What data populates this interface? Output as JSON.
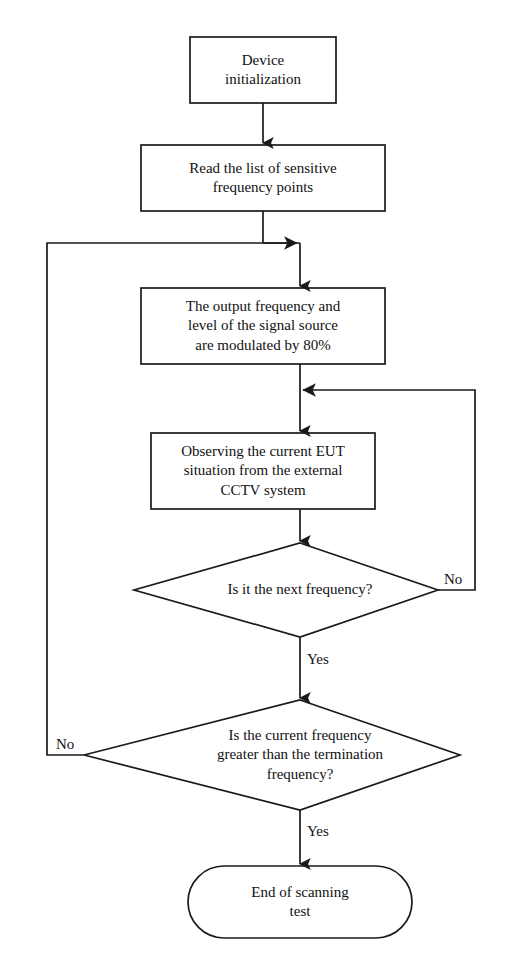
{
  "diagram": {
    "type": "flowchart",
    "orientation": "top-to-bottom",
    "stroke_color": "#1a1a1a",
    "fill_color": "#ffffff",
    "text_color": "#111111",
    "nodes": [
      {
        "id": "device-initialization",
        "shape": "rectangle",
        "text": "Device\ninitialization"
      },
      {
        "id": "read-sensitive-list",
        "shape": "rectangle",
        "text": "Read the list of sensitive\nfrequency points"
      },
      {
        "id": "modulate-signal-source",
        "shape": "rectangle",
        "text": "The output frequency and\nlevel of the signal source\nare modulated by 80%"
      },
      {
        "id": "observe-eut-cctv",
        "shape": "rectangle",
        "text": "Observing the current EUT\nsituation from the external\nCCTV system"
      },
      {
        "id": "is-next-frequency",
        "shape": "diamond",
        "text": "Is it the next frequency?"
      },
      {
        "id": "is-greater-than-termination",
        "shape": "diamond",
        "text": "Is the current frequency\ngreater than the termination\nfrequency?"
      },
      {
        "id": "end-of-scanning-test",
        "shape": "terminator",
        "text": "End of scanning\ntest"
      }
    ],
    "edge_labels": [
      {
        "id": "next-frequency-no",
        "text": "No"
      },
      {
        "id": "next-frequency-yes",
        "text": "Yes"
      },
      {
        "id": "termination-no",
        "text": "No"
      },
      {
        "id": "termination-yes",
        "text": "Yes"
      }
    ]
  }
}
